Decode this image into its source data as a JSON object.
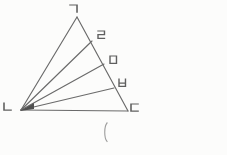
{
  "figure": {
    "background_color": "#fcfcfb",
    "line_color": "#6a6a6a",
    "label_color": "#5f5f5f",
    "paren_color": "#9b9b9b",
    "vertices": [
      {
        "id": "A",
        "label": "ㄱ",
        "x": 77,
        "y": 17,
        "label_x": 70,
        "label_y": 5
      },
      {
        "id": "B",
        "label": "ㄴ",
        "x": 21,
        "y": 110,
        "label_x": 4,
        "label_y": 103
      },
      {
        "id": "C",
        "label": "ㄷ",
        "x": 128,
        "y": 111,
        "label_x": 131,
        "label_y": 104
      }
    ],
    "side_points": [
      {
        "label": "ㄹ",
        "x": 92,
        "y": 41,
        "label_x": 98,
        "label_y": 31
      },
      {
        "label": "ㅁ",
        "x": 104,
        "y": 64,
        "label_x": 110,
        "label_y": 56
      },
      {
        "label": "ㅂ",
        "x": 114,
        "y": 88,
        "label_x": 119,
        "label_y": 79
      }
    ],
    "edges": [
      [
        "A",
        "B"
      ],
      [
        "B",
        "C"
      ],
      [
        "A",
        "C"
      ]
    ],
    "cevian_origin": "B",
    "bottom_text": "(",
    "bottom_text_x": 103,
    "bottom_text_y": 123
  }
}
